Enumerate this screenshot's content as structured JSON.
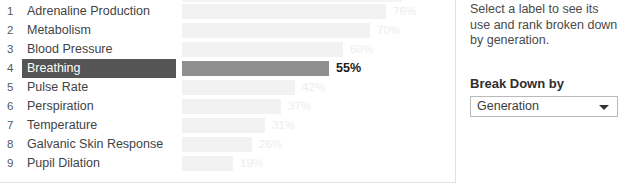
{
  "chart_data": {
    "type": "bar",
    "title": "",
    "xlabel": "",
    "ylabel": "",
    "orientation": "horizontal",
    "xlim": [
      0,
      100
    ],
    "grid": false,
    "legend": null,
    "value_suffix": "%",
    "categories": [
      "Adrenaline Production",
      "Metabolism",
      "Blood Pressure",
      "Breathing",
      "Pulse Rate",
      "Perspiration",
      "Temperature",
      "Galvanic Skin Response",
      "Pupil Dilation"
    ],
    "values": [
      76,
      70,
      60,
      55,
      42,
      37,
      31,
      26,
      19
    ],
    "ranks": [
      1,
      2,
      3,
      4,
      5,
      6,
      7,
      8,
      9
    ],
    "value_labels": [
      "76%",
      "70%",
      "60%",
      "55%",
      "42%",
      "37%",
      "31%",
      "26%",
      "19%"
    ],
    "selected_index": 3,
    "colors": {
      "bar": "#f2f2f2",
      "bar_selected": "#8f8f8f",
      "label_selected_bg": "#555555",
      "label_selected_text": "#ffffff",
      "value_text": "#ededed",
      "value_text_selected": "#1a1a1a",
      "panel_border": "#e2e2e2"
    }
  },
  "clipped_top_row": {
    "label": "Nervous System Response",
    "bar_width_pct": 82
  },
  "side_panel": {
    "hint": "Select a label to see its use and rank broken down by generation.",
    "breakdown_title": "Break Down by",
    "breakdown_selected": "Generation",
    "breakdown_options": [
      "Generation"
    ],
    "caret_icon": "chevron-down-icon"
  }
}
